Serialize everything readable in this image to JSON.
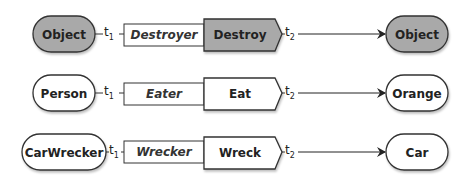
{
  "colors": {
    "filled": "#a9a9a9",
    "plain": "#ffffff",
    "stroke": "#333333",
    "text": "#222222"
  },
  "rows": [
    {
      "subject": "Object",
      "role": "Destroyer",
      "action": "Destroy",
      "object": "Object",
      "t1": "t",
      "t1_sub": "1",
      "t2": "t",
      "t2_sub": "2",
      "filled": true
    },
    {
      "subject": "Person",
      "role": "Eater",
      "action": "Eat",
      "object": "Orange",
      "t1": "t",
      "t1_sub": "1",
      "t2": "t",
      "t2_sub": "2",
      "filled": false
    },
    {
      "subject": "CarWrecker",
      "role": "Wrecker",
      "action": "Wreck",
      "object": "Car",
      "t1": "t",
      "t1_sub": "1",
      "t2": "t",
      "t2_sub": "2",
      "filled": false
    }
  ]
}
